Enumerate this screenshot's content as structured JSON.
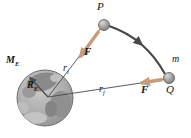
{
  "figure": {
    "labels": {
      "point_p": "P",
      "point_q": "Q",
      "particle_mass": "m",
      "force_at_p": "F",
      "force_at_q": "F",
      "initial_radius": {
        "main": "r",
        "sub": "i"
      },
      "final_radius": {
        "main": "r",
        "sub": "f"
      },
      "earth_mass": {
        "main": "M",
        "sub": "E"
      },
      "earth_radius": {
        "main": "R",
        "sub": "E"
      }
    },
    "colors": {
      "force_arrow": "#c59b7b",
      "path_line": "#474747",
      "radius_line": "#4a4a4a",
      "earth_base": "#b2b2b2",
      "ball": "#a0a0a0",
      "text": "#151515",
      "background": "#ffffff"
    }
  }
}
